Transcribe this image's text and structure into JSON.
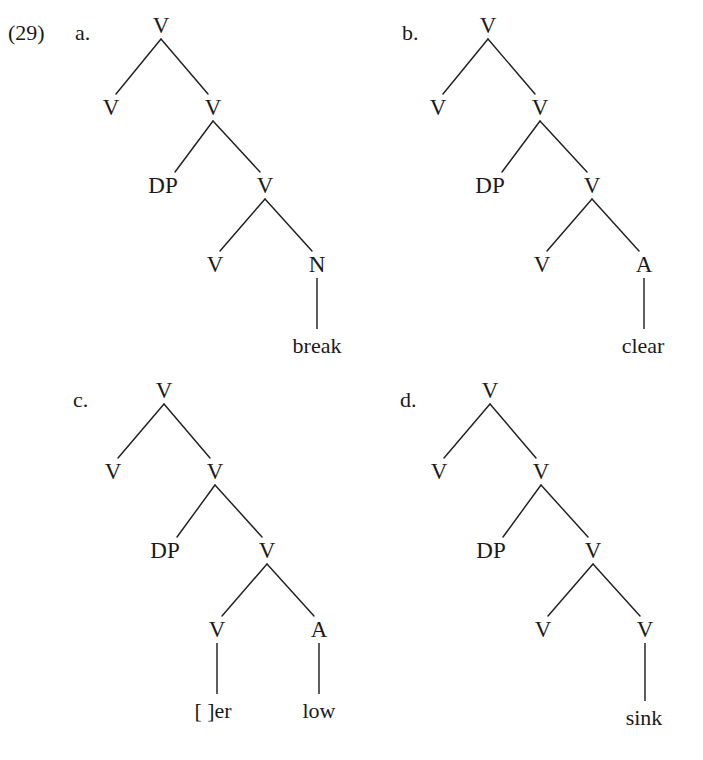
{
  "figure": {
    "example_number": "(29)",
    "background_color": "#ffffff",
    "ink_color": "#1a1a1a",
    "width": 703,
    "height": 760
  },
  "trees": [
    {
      "letter": "a.",
      "letter_x": 75,
      "letter_baseline": 40,
      "nodes": [
        {
          "name": "root",
          "label": "V",
          "x": 161,
          "y": 33
        },
        {
          "name": "spec-v",
          "label": "V",
          "x": 111,
          "y": 115
        },
        {
          "name": "vbar",
          "label": "V",
          "x": 213,
          "y": 115
        },
        {
          "name": "dp",
          "label": "DP",
          "x": 163,
          "y": 193
        },
        {
          "name": "inner-v",
          "label": "V",
          "x": 265,
          "y": 193
        },
        {
          "name": "leaf-v",
          "label": "V",
          "x": 215,
          "y": 272
        },
        {
          "name": "root-n",
          "label": "N",
          "x": 317,
          "y": 272
        }
      ],
      "branches": [
        {
          "from": "root",
          "to": "spec-v"
        },
        {
          "from": "root",
          "to": "vbar"
        },
        {
          "from": "vbar",
          "to": "dp"
        },
        {
          "from": "vbar",
          "to": "inner-v"
        },
        {
          "from": "inner-v",
          "to": "leaf-v"
        },
        {
          "from": "inner-v",
          "to": "root-n"
        }
      ],
      "terminals": [
        {
          "name": "terminal-break",
          "label": "break",
          "parent": "root-n",
          "x": 317,
          "baseline": 353
        }
      ]
    },
    {
      "letter": "b.",
      "letter_x": 402,
      "letter_baseline": 40,
      "nodes": [
        {
          "name": "root",
          "label": "V",
          "x": 488,
          "y": 33
        },
        {
          "name": "spec-v",
          "label": "V",
          "x": 438,
          "y": 115
        },
        {
          "name": "vbar",
          "label": "V",
          "x": 540,
          "y": 115
        },
        {
          "name": "dp",
          "label": "DP",
          "x": 490,
          "y": 193
        },
        {
          "name": "inner-v",
          "label": "V",
          "x": 592,
          "y": 193
        },
        {
          "name": "leaf-v",
          "label": "V",
          "x": 542,
          "y": 272
        },
        {
          "name": "root-a",
          "label": "A",
          "x": 644,
          "y": 272
        }
      ],
      "branches": [
        {
          "from": "root",
          "to": "spec-v"
        },
        {
          "from": "root",
          "to": "vbar"
        },
        {
          "from": "vbar",
          "to": "dp"
        },
        {
          "from": "vbar",
          "to": "inner-v"
        },
        {
          "from": "inner-v",
          "to": "leaf-v"
        },
        {
          "from": "inner-v",
          "to": "root-a"
        }
      ],
      "terminals": [
        {
          "name": "terminal-clear",
          "label": "clear",
          "parent": "root-a",
          "x": 643,
          "baseline": 353
        }
      ]
    },
    {
      "letter": "c.",
      "letter_x": 73,
      "letter_baseline": 407,
      "nodes": [
        {
          "name": "root",
          "label": "V",
          "x": 164,
          "y": 398
        },
        {
          "name": "spec-v",
          "label": "V",
          "x": 113,
          "y": 479
        },
        {
          "name": "vbar",
          "label": "V",
          "x": 215,
          "y": 479
        },
        {
          "name": "dp",
          "label": "DP",
          "x": 165,
          "y": 558
        },
        {
          "name": "inner-v",
          "label": "V",
          "x": 267,
          "y": 558
        },
        {
          "name": "leaf-v",
          "label": "V",
          "x": 217,
          "y": 637
        },
        {
          "name": "root-a",
          "label": "A",
          "x": 319,
          "y": 637
        }
      ],
      "branches": [
        {
          "from": "root",
          "to": "spec-v"
        },
        {
          "from": "root",
          "to": "vbar"
        },
        {
          "from": "vbar",
          "to": "dp"
        },
        {
          "from": "vbar",
          "to": "inner-v"
        },
        {
          "from": "inner-v",
          "to": "leaf-v"
        },
        {
          "from": "inner-v",
          "to": "root-a"
        }
      ],
      "terminals": [
        {
          "name": "terminal-er",
          "label": "[   ]er",
          "parent": "leaf-v",
          "x": 213,
          "baseline": 718
        },
        {
          "name": "terminal-low",
          "label": "low",
          "parent": "root-a",
          "x": 319,
          "baseline": 718
        }
      ]
    },
    {
      "letter": "d.",
      "letter_x": 400,
      "letter_baseline": 407,
      "nodes": [
        {
          "name": "root",
          "label": "V",
          "x": 490,
          "y": 398
        },
        {
          "name": "spec-v",
          "label": "V",
          "x": 439,
          "y": 479
        },
        {
          "name": "vbar",
          "label": "V",
          "x": 541,
          "y": 479
        },
        {
          "name": "dp",
          "label": "DP",
          "x": 491,
          "y": 558
        },
        {
          "name": "inner-v",
          "label": "V",
          "x": 593,
          "y": 558
        },
        {
          "name": "leaf-v",
          "label": "V",
          "x": 543,
          "y": 637
        },
        {
          "name": "root-v",
          "label": "V",
          "x": 645,
          "y": 637
        }
      ],
      "branches": [
        {
          "from": "root",
          "to": "spec-v"
        },
        {
          "from": "root",
          "to": "vbar"
        },
        {
          "from": "vbar",
          "to": "dp"
        },
        {
          "from": "vbar",
          "to": "inner-v"
        },
        {
          "from": "inner-v",
          "to": "leaf-v"
        },
        {
          "from": "inner-v",
          "to": "root-v"
        }
      ],
      "terminals": [
        {
          "name": "terminal-sink",
          "label": "sink",
          "parent": "root-v",
          "x": 644,
          "baseline": 725
        }
      ]
    }
  ]
}
